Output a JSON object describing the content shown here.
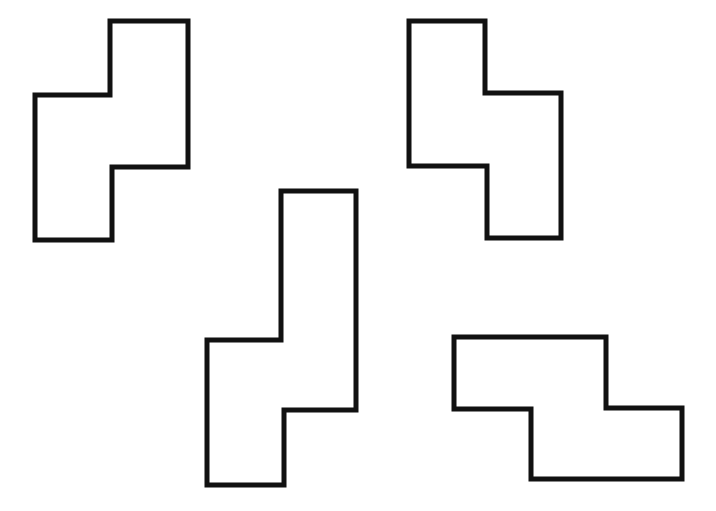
{
  "canvas": {
    "width": 716,
    "height": 511,
    "background": "#ffffff"
  },
  "style": {
    "stroke": "#111111",
    "stroke_width": 5,
    "fill": "#ffffff"
  },
  "shapes": [
    {
      "name": "shape-top-left",
      "description": "S/Z tetromino-like outline, vertical orientation, upper block right",
      "points": "110,21 188,21 188,167 112,167 112,240 35,240 35,95 110,95"
    },
    {
      "name": "shape-top-right",
      "description": "S/Z tetromino-like outline, vertical orientation, upper block left",
      "points": "409,21 485,21 485,93 561,93 561,238 487,238 487,166 409,166"
    },
    {
      "name": "shape-bottom-center",
      "description": "Elongated vertical zigzag outline, tall upper block right",
      "points": "281,191 356,191 356,410 284,410 284,485 207,485 207,340 281,340"
    },
    {
      "name": "shape-bottom-right",
      "description": "S/Z tetromino-like outline, horizontal orientation",
      "points": "454,337 606,337 606,408 682,408 682,479 531,479 531,409 454,409"
    }
  ]
}
